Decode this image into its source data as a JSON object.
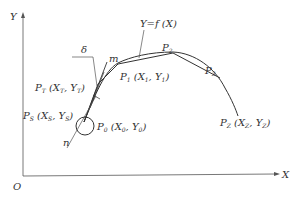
{
  "diagram": {
    "axes": {
      "x_label": "X",
      "y_label": "Y",
      "origin_label": "O"
    },
    "curve_label": "Y=f (X)",
    "labels": {
      "delta": "δ",
      "m": "m",
      "n": "n",
      "p2": {
        "base": "P",
        "sub": "2"
      },
      "p3": {
        "base": "P",
        "sub": "3"
      },
      "p1": {
        "base": "P",
        "sub": "1",
        "coord_open": " (X",
        "coord_sub1": "1",
        "coord_mid": ", Y",
        "coord_sub2": "1",
        "coord_close": ")"
      },
      "pt": {
        "base": "P",
        "sub": "T",
        "coord_open": " (X",
        "coord_sub1": "T",
        "coord_mid": ", Y",
        "coord_sub2": "T",
        "coord_close": ")"
      },
      "ps": {
        "base": "P",
        "sub": "S",
        "coord_open": " (X",
        "coord_sub1": "S",
        "coord_mid": ", Y",
        "coord_sub2": "S",
        "coord_close": ")"
      },
      "p0": {
        "base": "P",
        "sub": "0",
        "coord_open": " (X",
        "coord_sub1": "0",
        "coord_mid": ", Y",
        "coord_sub2": "0",
        "coord_close": ")"
      },
      "pz": {
        "base": "P",
        "sub": "Z",
        "coord_open": " (X",
        "coord_sub1": "Z",
        "coord_mid": ", Y",
        "coord_sub2": "Z",
        "coord_close": ")"
      }
    },
    "colors": {
      "line": "#333333",
      "background": "#ffffff"
    }
  }
}
